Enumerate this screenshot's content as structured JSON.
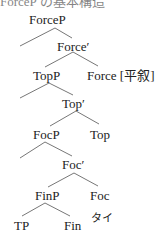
{
  "header_fragment": "ForceP の基本構造",
  "tree": {
    "nodes": {
      "forcep": "ForceP",
      "force_bar": "Force′",
      "topp": "TopP",
      "force_head": "Force [平叙]",
      "top_bar": "Top′",
      "focp": "FocP",
      "top_head": "Top",
      "foc_bar": "Foc′",
      "finp": "FinP",
      "foc_head": "Foc",
      "tp": "TP",
      "fin_head": "Fin",
      "fin_lex": "タイ"
    }
  }
}
